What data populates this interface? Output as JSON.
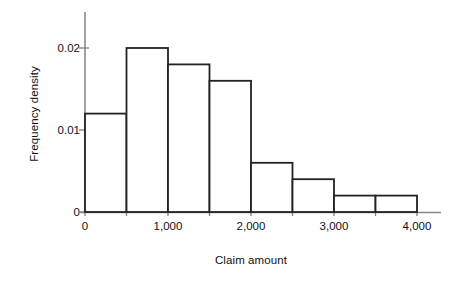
{
  "chart_data": {
    "type": "bar",
    "title": "",
    "xlabel": "Claim amount",
    "ylabel": "Frequency density",
    "categories": [
      "0-500",
      "500-1,000",
      "1,000-1,500",
      "1,500-2,000",
      "2,000-2,500",
      "2,500-3,000",
      "3,000-3,500",
      "3,500-4,000"
    ],
    "bin_edges": [
      0,
      500,
      1000,
      1500,
      2000,
      2500,
      3000,
      3500,
      4000
    ],
    "values": [
      0.012,
      0.02,
      0.018,
      0.016,
      0.006,
      0.004,
      0.002,
      0.002
    ],
    "xlim": [
      0,
      4000
    ],
    "ylim": [
      0,
      0.023
    ],
    "x_ticks": [
      0,
      1000,
      2000,
      3000,
      4000
    ],
    "x_tick_labels": [
      "0",
      "1,000",
      "2,000",
      "3,000",
      "4,000"
    ],
    "x_minor_ticks": [
      500,
      1500,
      2500,
      3500
    ],
    "y_ticks": [
      0,
      0.01,
      0.02
    ],
    "y_tick_labels": [
      "0",
      "0.01",
      "0.02"
    ],
    "grid": false,
    "legend": null,
    "bar_fill": "#ffffff",
    "bar_stroke": "#222222",
    "axis_color": "#808080",
    "text_color": "#111111"
  },
  "axes": {
    "x_title": "Claim amount",
    "y_title": "Frequency density",
    "y_labels": [
      "0.02",
      "0.01",
      "0"
    ],
    "x_labels": [
      "0",
      "1,000",
      "2,000",
      "3,000",
      "4,000"
    ]
  }
}
